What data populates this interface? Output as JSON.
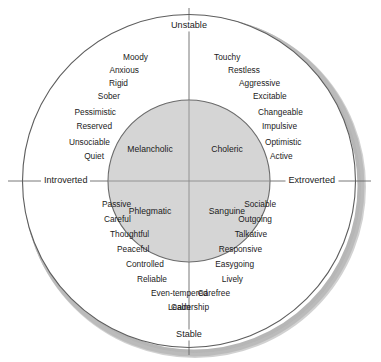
{
  "figure": {
    "background_color": "#ffffff",
    "outer_circle_stroke": "#555555",
    "inner_circle_fill": "#d5d5d5",
    "inner_circle_stroke": "#666666",
    "shadow_color": "#9a9a9a",
    "text_color": "#1b1b1b"
  },
  "axes": {
    "top_label": "Unstable",
    "bottom_label": "Stable",
    "left_label": "Introverted",
    "right_label": "Extroverted"
  },
  "temperaments": {
    "upper_left": "Melancholic",
    "upper_right": "Choleric",
    "lower_left": "Phlegmatic",
    "lower_right": "Sanguine"
  },
  "quadrants": {
    "melancholic": {
      "name": "Melancholic",
      "position": "unstable-introverted",
      "traits": [
        "Moody",
        "Anxious",
        "Rigid",
        "Sober",
        "Pessimistic",
        "Reserved",
        "Unsociable",
        "Quiet"
      ]
    },
    "choleric": {
      "name": "Choleric",
      "position": "unstable-extroverted",
      "traits": [
        "Touchy",
        "Restless",
        "Aggressive",
        "Excitable",
        "Changeable",
        "Impulsive",
        "Optimistic",
        "Active"
      ]
    },
    "phlegmatic": {
      "name": "Phlegmatic",
      "position": "stable-introverted",
      "traits": [
        "Passive",
        "Careful",
        "Thoughtful",
        "Peaceful",
        "Controlled",
        "Reliable",
        "Even-tempered",
        "Calm"
      ]
    },
    "sanguine": {
      "name": "Sanguine",
      "position": "stable-extroverted",
      "traits": [
        "Sociable",
        "Outgoing",
        "Talkative",
        "Responsive",
        "Easygoing",
        "Lively",
        "Carefree",
        "Leadership"
      ]
    }
  },
  "layout": {
    "melancholic_trait_positions": [
      {
        "x": 148,
        "y": 57
      },
      {
        "x": 139,
        "y": 70
      },
      {
        "x": 128,
        "y": 83
      },
      {
        "x": 120,
        "y": 96
      },
      {
        "x": 116,
        "y": 112
      },
      {
        "x": 112,
        "y": 126
      },
      {
        "x": 110,
        "y": 142
      },
      {
        "x": 104,
        "y": 156
      }
    ],
    "choleric_trait_positions": [
      {
        "x": 214,
        "y": 57
      },
      {
        "x": 228,
        "y": 70
      },
      {
        "x": 239,
        "y": 83
      },
      {
        "x": 253,
        "y": 96
      },
      {
        "x": 258,
        "y": 112
      },
      {
        "x": 262,
        "y": 126
      },
      {
        "x": 265,
        "y": 142
      },
      {
        "x": 270,
        "y": 156
      }
    ],
    "phlegmatic_trait_positions": [
      {
        "x": 102,
        "y": 204
      },
      {
        "x": 104,
        "y": 219
      },
      {
        "x": 110,
        "y": 234
      },
      {
        "x": 117,
        "y": 249
      },
      {
        "x": 126,
        "y": 264
      },
      {
        "x": 137,
        "y": 279
      },
      {
        "x": 151,
        "y": 293
      },
      {
        "x": 171,
        "y": 307
      }
    ],
    "sanguine_trait_positions": [
      {
        "x": 276,
        "y": 204
      },
      {
        "x": 272,
        "y": 219
      },
      {
        "x": 267,
        "y": 234
      },
      {
        "x": 262,
        "y": 249
      },
      {
        "x": 254,
        "y": 264
      },
      {
        "x": 243,
        "y": 279
      },
      {
        "x": 230,
        "y": 293
      },
      {
        "x": 209,
        "y": 307
      }
    ]
  }
}
